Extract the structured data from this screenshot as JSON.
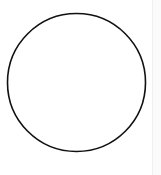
{
  "diagram": {
    "shape": "circle",
    "center": [
      76.5,
      82.5
    ],
    "radius": 69,
    "stroke_color": "#111111",
    "stroke_width": 1.6,
    "fill_color": "#ffffff"
  }
}
